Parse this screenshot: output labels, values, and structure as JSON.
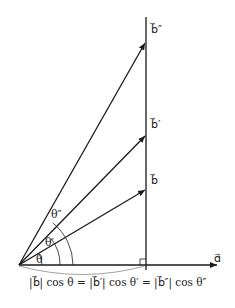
{
  "diagram": {
    "vectors": [
      {
        "id": "a",
        "label": "a⃗",
        "display": "ɑ⃗"
      },
      {
        "id": "b",
        "label": "b⃗",
        "display": "b⃗"
      },
      {
        "id": "b_prime",
        "label": "b⃗′",
        "display": "b⃗′"
      },
      {
        "id": "b_double_prime",
        "label": "b⃗″",
        "display": "b⃗″"
      }
    ],
    "angles": [
      {
        "id": "theta",
        "label": "θ"
      },
      {
        "id": "theta_prime",
        "label": "θ′"
      },
      {
        "id": "theta_double_prime",
        "label": "θ″"
      }
    ],
    "right_angle_marker": true,
    "equation": "|b⃗| cos θ = |b⃗′| cos θ′ = |b⃗″| cos θ″"
  }
}
